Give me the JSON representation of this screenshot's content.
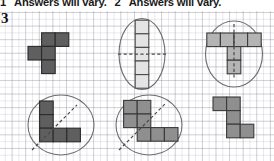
{
  "header": {
    "answers": [
      {
        "number": "1",
        "text": "Answers will vary."
      },
      {
        "number": "2",
        "text": "Answers will vary."
      }
    ]
  },
  "question": {
    "number": "3"
  },
  "colors": {
    "cell_dark": "#5f5f5f",
    "cell_mid": "#8f8f8f",
    "cell_light": "#e4e4e4",
    "cell_ltgray": "#b4b4b4",
    "outline": "#2b2b2b",
    "oval_stroke": "#6d6d6d",
    "symmetry_line": "#4a4a4a",
    "grid_line": "#9696a5"
  },
  "figures": [
    {
      "id": "figure-1",
      "name": "pentomino-f-shape",
      "shade": "dark",
      "enclosure": "none",
      "symmetry_line": "none",
      "cells": 5
    },
    {
      "id": "figure-2",
      "name": "pentomino-i-vertical-strip",
      "shade": "light",
      "enclosure": "ellipse",
      "symmetry_line": "horizontal",
      "cells": 5
    },
    {
      "id": "figure-3",
      "name": "pentomino-t-shape",
      "shade": "ltgray",
      "enclosure": "ellipse",
      "symmetry_line": "vertical",
      "cells": 5
    },
    {
      "id": "figure-4",
      "name": "pentomino-l-shape",
      "shade": "dark",
      "enclosure": "circle",
      "symmetry_line": "diagonal",
      "cells": 5
    },
    {
      "id": "figure-5",
      "name": "pentomino-w-zigzag-shape",
      "shade": "mid",
      "enclosure": "circle",
      "symmetry_line": "diagonal",
      "cells": 5
    },
    {
      "id": "figure-6",
      "name": "pentomino-s-shape",
      "shade": "mid",
      "enclosure": "none",
      "symmetry_line": "none",
      "cells": 5
    }
  ]
}
